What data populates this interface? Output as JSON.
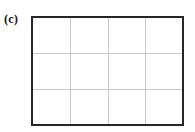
{
  "figure": {
    "panel_label": "(c)",
    "background_color": "#ffffff"
  },
  "chart_data": {
    "type": "line",
    "title": "(c)",
    "subtitle": "",
    "xlabel": "",
    "ylabel": "",
    "series": [],
    "categories": [],
    "annotations": [],
    "legend": {
      "entries": [],
      "position": "none",
      "visible": false
    },
    "axes": {
      "x_tick_labels": [],
      "y_tick_labels": [],
      "x_ticks_visible": false,
      "y_ticks_visible": false,
      "frame_visible": true,
      "frame_color": "#262626",
      "frame_width_px": 2
    },
    "grid": {
      "visible": true,
      "color": "#c9c9c9",
      "line_width_px": 1,
      "vertical_line_count": 3,
      "horizontal_line_count": 2,
      "columns": 4,
      "rows": 3,
      "vertical_positions_pct": [
        25,
        50,
        75
      ],
      "horizontal_positions_pct": [
        33.33,
        66.67
      ]
    },
    "data_points": []
  }
}
